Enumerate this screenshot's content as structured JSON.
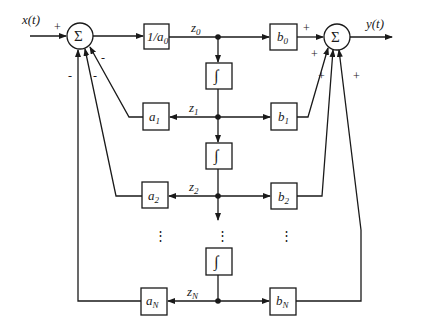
{
  "diagram": {
    "type": "block diagram (direct form state-variable realization)",
    "input_label": "x(t)",
    "output_label": "y(t)",
    "summer_symbol": "Σ",
    "integrator_symbol": "∫",
    "gain_in": {
      "main": "1/a",
      "sub": "0"
    },
    "states": [
      {
        "main": "z",
        "sub": "0"
      },
      {
        "main": "z",
        "sub": "1"
      },
      {
        "main": "z",
        "sub": "2"
      },
      {
        "main": "z",
        "sub": "N"
      }
    ],
    "feedback_gains": [
      {
        "main": "a",
        "sub": "1"
      },
      {
        "main": "a",
        "sub": "2"
      },
      {
        "main": "a",
        "sub": "N"
      }
    ],
    "output_gains": [
      {
        "main": "b",
        "sub": "0"
      },
      {
        "main": "b",
        "sub": "1"
      },
      {
        "main": "b",
        "sub": "2"
      },
      {
        "main": "b",
        "sub": "N"
      }
    ],
    "input_sum_signs": {
      "input": "+",
      "fb1": "-",
      "fb2": "-",
      "fbN": "-"
    },
    "output_sum_signs": {
      "b0": "+",
      "b1": "+",
      "b2": "+",
      "bN": "+"
    },
    "ellipsis": "⋮"
  }
}
